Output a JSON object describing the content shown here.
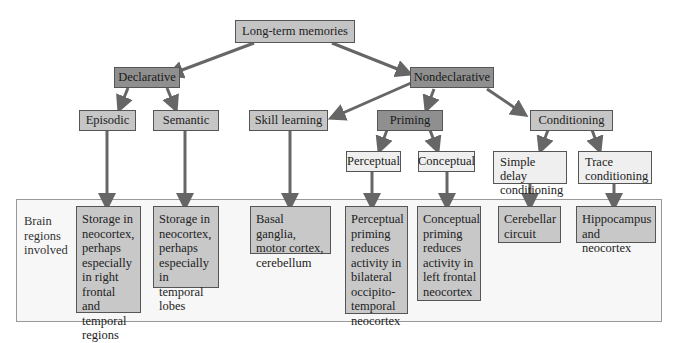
{
  "diagram": {
    "root": {
      "label": "Long-term memories"
    },
    "level1": [
      {
        "label": "Declarative"
      },
      {
        "label": "Nondeclarative"
      }
    ],
    "level2": [
      {
        "label": "Episodic"
      },
      {
        "label": "Semantic"
      },
      {
        "label": "Skill learning"
      },
      {
        "label": "Priming"
      },
      {
        "label": "Conditioning"
      }
    ],
    "level3": [
      {
        "label": "Perceptual"
      },
      {
        "label": "Conceptual"
      },
      {
        "label": "Simple delay conditioning"
      },
      {
        "label": "Trace conditioning"
      }
    ],
    "regions_label": "Brain regions involved",
    "regions": [
      {
        "for": "Episodic",
        "label": "Storage in neocortex, perhaps especially in right frontal and temporal regions"
      },
      {
        "for": "Semantic",
        "label": "Storage in neocortex, perhaps especially in temporal lobes"
      },
      {
        "for": "Skill learning",
        "label": "Basal ganglia, motor cortex, cerebellum"
      },
      {
        "for": "Perceptual",
        "label": "Perceptual priming reduces activity in bilateral occipito-temporal neocortex"
      },
      {
        "for": "Conceptual",
        "label": "Conceptual priming reduces activity in left frontal neocortex"
      },
      {
        "for": "Simple delay conditioning",
        "label": "Cerebellar circuit"
      },
      {
        "for": "Trace conditioning",
        "label": "Hippocampus and neocortex"
      }
    ],
    "colors": {
      "arrow": "#666666",
      "root_fill": "#c4c4c4",
      "level1_fill": "#8f8f8f",
      "level2_fill": "#c6c6c6",
      "level3_fill": "#efefef",
      "region_fill": "#c8c8c8",
      "panel_fill": "#f7f7f7"
    }
  }
}
